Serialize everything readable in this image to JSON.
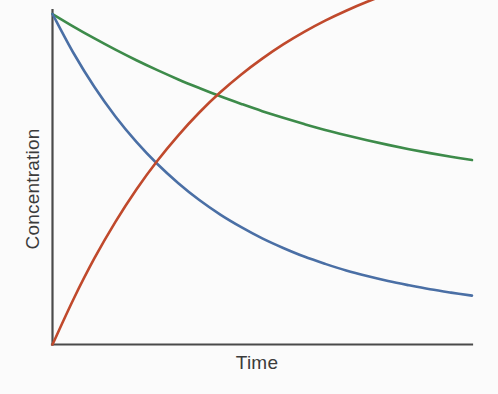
{
  "figure": {
    "background_color": "#fbfbfb",
    "axis_color": "#4a4a4a",
    "label_color": "#3b3b3b"
  },
  "chart_data": {
    "type": "line",
    "title": "",
    "subtitle": "",
    "xlabel": "Time",
    "ylabel": "Concentration",
    "grid": false,
    "legend": null,
    "legend_position": "none",
    "axis_ticks": {
      "x": [],
      "y": []
    },
    "xlim": [
      0,
      1
    ],
    "ylim": [
      0,
      1
    ],
    "annotations": [],
    "x": [
      0,
      0.05,
      0.1,
      0.15,
      0.2,
      0.25,
      0.3,
      0.35,
      0.4,
      0.45,
      0.5,
      0.55,
      0.6,
      0.65,
      0.7,
      0.75,
      0.8,
      0.85,
      0.9,
      0.95,
      1
    ],
    "series": [
      {
        "name": "slow-decay",
        "color": "#3d8b4a",
        "description": "slowly decaying reactant concentration",
        "values": [
          1.0,
          0.962,
          0.926,
          0.892,
          0.86,
          0.83,
          0.802,
          0.776,
          0.751,
          0.728,
          0.706,
          0.686,
          0.667,
          0.649,
          0.633,
          0.618,
          0.604,
          0.591,
          0.579,
          0.568,
          0.558
        ]
      },
      {
        "name": "fast-decay",
        "color": "#4a6fa5",
        "description": "rapidly decaying reactant concentration",
        "values": [
          1.0,
          0.882,
          0.779,
          0.69,
          0.613,
          0.546,
          0.488,
          0.437,
          0.393,
          0.355,
          0.321,
          0.292,
          0.266,
          0.244,
          0.224,
          0.207,
          0.192,
          0.179,
          0.167,
          0.157,
          0.148
        ]
      },
      {
        "name": "product-growth",
        "color": "#c0492c",
        "description": "rising product concentration approaching plateau",
        "values": [
          0.0,
          0.137,
          0.261,
          0.371,
          0.469,
          0.556,
          0.633,
          0.702,
          0.763,
          0.817,
          0.865,
          0.908,
          0.946,
          0.98,
          1.01,
          1.037,
          1.061,
          1.082,
          1.101,
          1.118,
          1.133
        ]
      }
    ],
    "intersections": [
      {
        "between": [
          "fast-decay",
          "product-growth"
        ],
        "x": 0.467,
        "y": 0.391
      },
      {
        "between": [
          "slow-decay",
          "product-growth"
        ],
        "x": 0.917,
        "y": 0.572
      }
    ]
  }
}
